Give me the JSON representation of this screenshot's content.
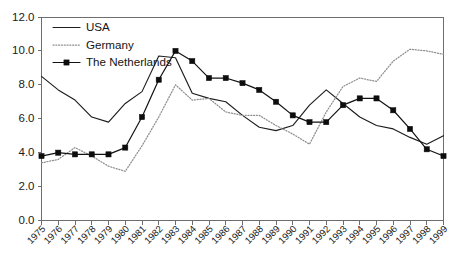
{
  "chart_data": {
    "type": "line",
    "title": "",
    "subtitle": "",
    "xlabel": "",
    "ylabel": "",
    "xlim": [
      1975,
      1999
    ],
    "ylim": [
      0.0,
      12.0
    ],
    "ytick_step": 2.0,
    "grid": false,
    "legend_position": "top-left",
    "x": [
      1975,
      1976,
      1977,
      1978,
      1979,
      1980,
      1981,
      1982,
      1983,
      1984,
      1985,
      1986,
      1987,
      1988,
      1989,
      1990,
      1991,
      1992,
      1993,
      1994,
      1995,
      1996,
      1997,
      1998,
      1999
    ],
    "ytick_labels": [
      "0.0",
      "2.0",
      "4.0",
      "6.0",
      "8.0",
      "10.0",
      "12.0"
    ],
    "ytick_values": [
      0.0,
      2.0,
      4.0,
      6.0,
      8.0,
      10.0,
      12.0
    ],
    "xtick_labels": [
      "1975",
      "1976",
      "1977",
      "1978",
      "1979",
      "1980",
      "1981",
      "1982",
      "1983",
      "1984",
      "1985",
      "1986",
      "1987",
      "1988",
      "1989",
      "1990",
      "1991",
      "1992",
      "1993",
      "1994",
      "1995",
      "1996",
      "1997",
      "1998",
      "1999"
    ],
    "series": [
      {
        "name": "USA",
        "style": "solid",
        "color": "#1d1d1d",
        "marker": "none",
        "values": [
          8.5,
          7.7,
          7.1,
          6.1,
          5.8,
          6.9,
          7.6,
          9.7,
          9.6,
          7.5,
          7.2,
          7.0,
          6.2,
          5.5,
          5.3,
          5.6,
          6.8,
          7.7,
          6.9,
          6.1,
          5.6,
          5.4,
          4.9,
          4.5,
          5.0
        ]
      },
      {
        "name": "Germany",
        "style": "dotted",
        "color": "#8e8e8e",
        "marker": "none",
        "values": [
          3.4,
          3.6,
          4.3,
          3.8,
          3.2,
          2.9,
          4.4,
          6.1,
          8.0,
          7.1,
          7.2,
          6.4,
          6.2,
          6.2,
          5.6,
          5.1,
          4.5,
          6.4,
          7.9,
          8.4,
          8.2,
          9.4,
          10.1,
          10.0,
          9.8
        ]
      },
      {
        "name": "The Netherlands",
        "style": "solid-marker",
        "color": "#121212",
        "marker": "square",
        "values": [
          3.8,
          4.0,
          3.9,
          3.9,
          3.9,
          4.3,
          6.1,
          8.3,
          10.0,
          9.4,
          8.4,
          8.4,
          8.1,
          7.7,
          7.0,
          6.2,
          5.8,
          5.8,
          6.8,
          7.2,
          7.2,
          6.5,
          5.4,
          4.2,
          3.8
        ]
      }
    ],
    "annotations": []
  },
  "legend": {
    "items": [
      {
        "label": "USA"
      },
      {
        "label": "Germany"
      },
      {
        "label": "The Netherlands"
      }
    ]
  }
}
